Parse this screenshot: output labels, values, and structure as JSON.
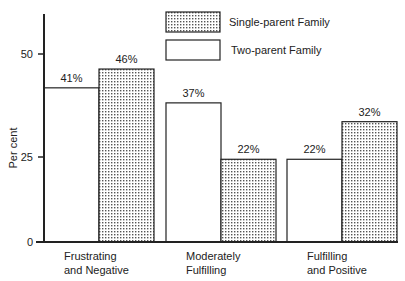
{
  "chart_data": {
    "type": "bar",
    "title": "",
    "xlabel": "",
    "ylabel": "Per cent",
    "ylim": [
      0,
      55
    ],
    "yticks": [
      0,
      25,
      50
    ],
    "grid": false,
    "legend_position": "top-right",
    "categories": [
      "Frustrating and Negative",
      "Moderately Fulfilling",
      "Fulfilling and Positive"
    ],
    "category_lines": [
      [
        "Frustrating",
        "and Negative"
      ],
      [
        "Moderately",
        "Fulfilling"
      ],
      [
        "Fulfilling",
        "and Positive"
      ]
    ],
    "series": [
      {
        "name": "Two-parent Family",
        "pattern": "plain",
        "values": [
          41,
          37,
          22
        ],
        "labels": [
          "41%",
          "37%",
          "22%"
        ]
      },
      {
        "name": "Single-parent Family",
        "pattern": "dotted",
        "values": [
          46,
          22,
          32
        ],
        "labels": [
          "46%",
          "22%",
          "32%"
        ]
      }
    ]
  },
  "legend": {
    "items": [
      {
        "label": "Single-parent Family",
        "pattern": "dotted"
      },
      {
        "label": "Two-parent Family",
        "pattern": "plain"
      }
    ]
  },
  "colors": {
    "ink": "#222222",
    "background": "#ffffff",
    "dots": "#555555"
  }
}
